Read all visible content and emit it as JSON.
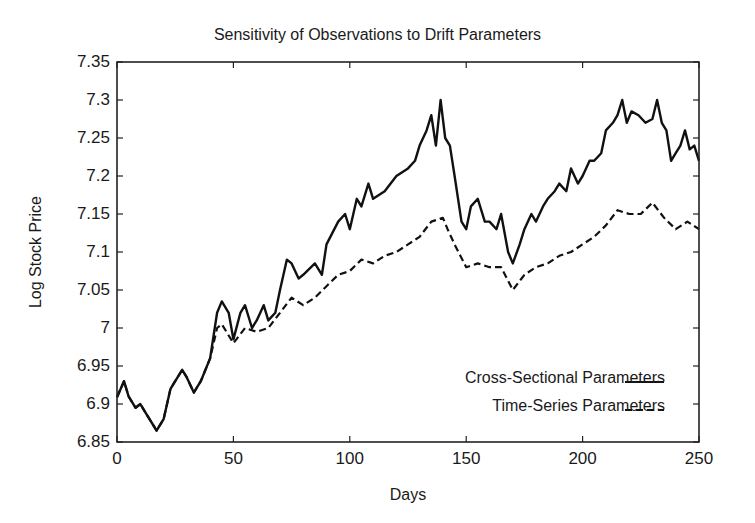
{
  "chart_data": {
    "type": "line",
    "title": "Sensitivity of Observations to Drift Parameters",
    "xlabel": "Days",
    "ylabel": "Log Stock Price",
    "xlim": [
      0,
      250
    ],
    "ylim": [
      6.85,
      7.35
    ],
    "xticks": [
      0,
      50,
      100,
      150,
      200,
      250
    ],
    "yticks": [
      6.85,
      6.9,
      6.95,
      7.0,
      7.05,
      7.1,
      7.15,
      7.2,
      7.25,
      7.3,
      7.35
    ],
    "xtick_labels": [
      "0",
      "50",
      "100",
      "150",
      "200",
      "250"
    ],
    "ytick_labels": [
      "6.85",
      "6.9",
      "6.95",
      "7",
      "7.05",
      "7.1",
      "7.15",
      "7.2",
      "7.25",
      "7.3",
      "7.35"
    ],
    "grid": false,
    "legend_position": "lower right",
    "series": [
      {
        "name": "Cross-Sectional Parameters",
        "style": "solid",
        "x": [
          0,
          3,
          5,
          8,
          10,
          12,
          15,
          17,
          20,
          23,
          25,
          28,
          30,
          33,
          36,
          40,
          43,
          45,
          48,
          50,
          53,
          55,
          58,
          60,
          63,
          65,
          68,
          70,
          73,
          75,
          78,
          80,
          85,
          88,
          90,
          95,
          98,
          100,
          103,
          105,
          108,
          110,
          115,
          120,
          125,
          128,
          130,
          133,
          135,
          137,
          139,
          141,
          143,
          145,
          148,
          150,
          152,
          155,
          158,
          160,
          163,
          165,
          168,
          170,
          173,
          175,
          178,
          180,
          183,
          185,
          188,
          190,
          193,
          195,
          198,
          200,
          203,
          205,
          208,
          210,
          213,
          215,
          217,
          219,
          221,
          224,
          227,
          230,
          232,
          234,
          236,
          238,
          240,
          242,
          244,
          246,
          248,
          250
        ],
        "values": [
          6.909,
          6.93,
          6.91,
          6.895,
          6.9,
          6.89,
          6.875,
          6.865,
          6.88,
          6.92,
          6.93,
          6.945,
          6.935,
          6.915,
          6.93,
          6.96,
          7.02,
          7.035,
          7.02,
          6.985,
          7.02,
          7.03,
          7.0,
          7.01,
          7.03,
          7.01,
          7.02,
          7.05,
          7.09,
          7.085,
          7.065,
          7.07,
          7.085,
          7.07,
          7.11,
          7.14,
          7.15,
          7.13,
          7.17,
          7.16,
          7.19,
          7.17,
          7.18,
          7.2,
          7.21,
          7.22,
          7.24,
          7.26,
          7.28,
          7.24,
          7.3,
          7.25,
          7.24,
          7.2,
          7.14,
          7.13,
          7.16,
          7.17,
          7.14,
          7.14,
          7.13,
          7.15,
          7.1,
          7.085,
          7.11,
          7.13,
          7.15,
          7.14,
          7.16,
          7.17,
          7.18,
          7.19,
          7.18,
          7.21,
          7.19,
          7.2,
          7.22,
          7.22,
          7.23,
          7.26,
          7.27,
          7.28,
          7.3,
          7.27,
          7.285,
          7.28,
          7.27,
          7.275,
          7.3,
          7.27,
          7.26,
          7.22,
          7.23,
          7.24,
          7.26,
          7.235,
          7.24,
          7.22
        ]
      },
      {
        "name": "Time-Series Parameters",
        "style": "dashed",
        "x": [
          0,
          3,
          5,
          8,
          10,
          12,
          15,
          17,
          20,
          23,
          25,
          28,
          30,
          33,
          36,
          40,
          43,
          45,
          50,
          55,
          60,
          65,
          70,
          75,
          80,
          85,
          90,
          95,
          100,
          105,
          110,
          115,
          120,
          125,
          130,
          135,
          140,
          142,
          145,
          150,
          155,
          160,
          165,
          170,
          175,
          180,
          185,
          190,
          195,
          200,
          205,
          210,
          215,
          220,
          225,
          230,
          235,
          240,
          245,
          250
        ],
        "values": [
          6.909,
          6.93,
          6.91,
          6.895,
          6.9,
          6.89,
          6.875,
          6.865,
          6.88,
          6.92,
          6.93,
          6.945,
          6.935,
          6.915,
          6.93,
          6.96,
          7.0,
          7.005,
          6.98,
          7.0,
          6.995,
          7.0,
          7.02,
          7.04,
          7.03,
          7.04,
          7.055,
          7.07,
          7.075,
          7.09,
          7.085,
          7.095,
          7.1,
          7.11,
          7.12,
          7.14,
          7.145,
          7.13,
          7.11,
          7.08,
          7.085,
          7.08,
          7.08,
          7.05,
          7.07,
          7.08,
          7.085,
          7.095,
          7.1,
          7.11,
          7.12,
          7.135,
          7.155,
          7.15,
          7.15,
          7.165,
          7.145,
          7.13,
          7.14,
          7.13
        ]
      }
    ]
  }
}
